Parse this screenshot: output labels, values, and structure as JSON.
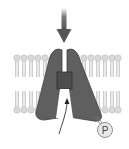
{
  "diagram": {
    "phosphate_label": "P",
    "colors": {
      "protein": "#5f5f5f",
      "protein_outline": "#3d3d3d",
      "gate": "#4a4a4a",
      "lipid_head": "#d6d6d6",
      "lipid_tail": "#c8c8c8",
      "arrow": "#555555",
      "phosphate_fill": "#e8e8e8"
    },
    "elements": [
      {
        "name": "extracellular-arrow",
        "direction": "down"
      },
      {
        "name": "lipid-bilayer"
      },
      {
        "name": "channel-protein",
        "subunits": 2
      },
      {
        "name": "gate-block"
      },
      {
        "name": "intracellular-curved-arrow",
        "direction": "up"
      },
      {
        "name": "phosphate-group",
        "label": "P"
      }
    ]
  }
}
